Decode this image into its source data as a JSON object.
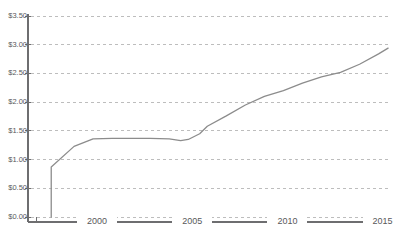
{
  "chart_data": {
    "type": "line",
    "title": "",
    "subtitle": "",
    "xlabel": "",
    "ylabel": "",
    "xlim": [
      1997,
      2015.6
    ],
    "ylim": [
      0,
      3.5
    ],
    "grid": true,
    "legend": null,
    "y_tick_labels": [
      "$3.50",
      "$3.00",
      "$2.50",
      "$2.00",
      "$1.50",
      "$1.00",
      "$0.50",
      "$0.00"
    ],
    "y_tick_values": [
      3.5,
      3.0,
      2.5,
      2.0,
      1.5,
      1.0,
      0.5,
      0.0
    ],
    "x_tick_labels": [
      "2000",
      "2005",
      "2010",
      "2015"
    ],
    "x_tick_values": [
      2000,
      2005,
      2010,
      2015
    ],
    "line_color": "#8c8c8c",
    "grid_color": "#bdbdbd",
    "axis_color": "#6e6e70",
    "background_color": "#ffffff",
    "series": [
      {
        "name": "",
        "x": [
          1997.8,
          1997.8,
          1999.0,
          2000.0,
          2001.0,
          2002.0,
          2003.0,
          2004.0,
          2004.6,
          2005.0,
          2005.6,
          2006.0,
          2007.0,
          2008.0,
          2009.0,
          2010.0,
          2011.0,
          2012.0,
          2013.0,
          2014.0,
          2015.0,
          2015.5
        ],
        "y": [
          0.0,
          0.87,
          1.23,
          1.36,
          1.37,
          1.37,
          1.37,
          1.36,
          1.33,
          1.35,
          1.45,
          1.58,
          1.76,
          1.95,
          2.1,
          2.2,
          2.33,
          2.44,
          2.52,
          2.66,
          2.84,
          2.94
        ]
      }
    ]
  }
}
